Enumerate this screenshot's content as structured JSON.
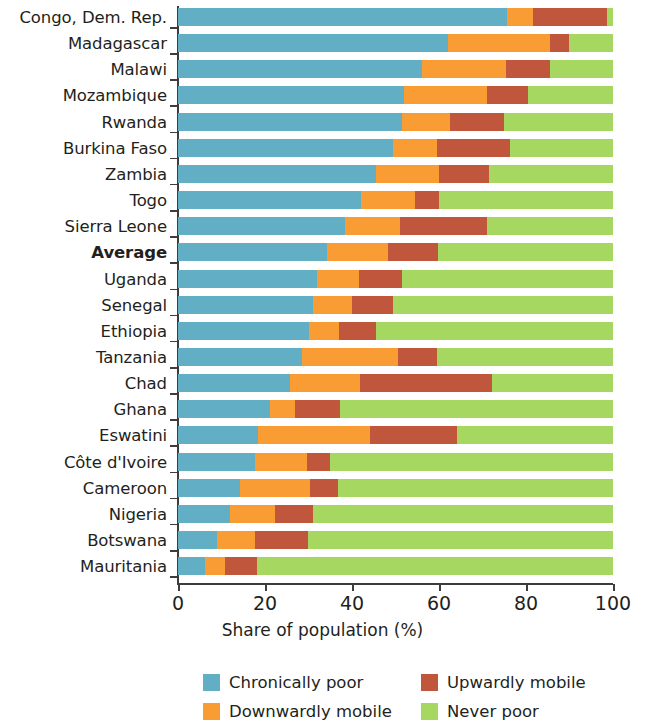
{
  "chart_data": {
    "type": "bar",
    "subtype": "horizontal-stacked-100",
    "title": "",
    "xlabel": "Share of population (%)",
    "ylabel": "",
    "xlim": [
      0,
      100
    ],
    "xticks": [
      0,
      20,
      40,
      60,
      80,
      100
    ],
    "xtick_labels": [
      "0",
      "20",
      "40",
      "60",
      "80",
      "100"
    ],
    "grid": false,
    "legend_position": "bottom",
    "categories": [
      "Congo, Dem. Rep.",
      "Madagascar",
      "Malawi",
      "Mozambique",
      "Rwanda",
      "Burkina Faso",
      "Zambia",
      "Togo",
      "Sierra Leone",
      "Average",
      "Uganda",
      "Senegal",
      "Ethiopia",
      "Tanzania",
      "Chad",
      "Ghana",
      "Eswatini",
      "Côte d'Ivoire",
      "Cameroon",
      "Nigeria",
      "Botswana",
      "Mauritania"
    ],
    "emphasized_categories": [
      "Average"
    ],
    "series": [
      {
        "name": "Chronically poor",
        "color": "#62AEC4",
        "values": [
          75.6,
          62.0,
          56.0,
          52.0,
          51.5,
          49.4,
          45.5,
          42.0,
          38.5,
          34.2,
          32.0,
          31.0,
          30.0,
          28.5,
          25.7,
          21.1,
          18.4,
          17.7,
          14.3,
          12.0,
          9.0,
          6.2
        ]
      },
      {
        "name": "Downwardly mobile",
        "color": "#F89C33",
        "values": [
          6.0,
          23.5,
          19.4,
          19.0,
          11.0,
          10.1,
          14.5,
          12.5,
          12.5,
          14.1,
          9.5,
          9.0,
          7.0,
          22.1,
          16.1,
          5.8,
          25.7,
          12.0,
          16.0,
          10.3,
          8.7,
          4.6
        ]
      },
      {
        "name": "Upwardly mobile",
        "color": "#C0563C",
        "values": [
          17.0,
          4.5,
          10.1,
          9.5,
          12.5,
          16.8,
          11.5,
          5.5,
          20.0,
          11.5,
          10.0,
          9.5,
          8.5,
          8.9,
          30.4,
          10.3,
          20.0,
          5.2,
          6.5,
          8.7,
          12.2,
          7.4
        ]
      },
      {
        "name": "Never poor",
        "color": "#A6D761",
        "values": [
          1.4,
          10.0,
          14.5,
          19.5,
          25.0,
          23.7,
          28.5,
          40.0,
          29.0,
          40.2,
          48.5,
          50.5,
          54.5,
          40.5,
          27.8,
          62.8,
          35.9,
          65.1,
          63.2,
          69.0,
          70.1,
          81.8
        ]
      }
    ]
  },
  "axis": {
    "x_title": "Share of population (%)"
  },
  "legend": {
    "entries": [
      {
        "label": "Chronically poor",
        "color": "#62AEC4"
      },
      {
        "label": "Upwardly mobile",
        "color": "#C0563C"
      },
      {
        "label": "Downwardly mobile",
        "color": "#F89C33"
      },
      {
        "label": "Never poor",
        "color": "#A6D761"
      }
    ]
  }
}
